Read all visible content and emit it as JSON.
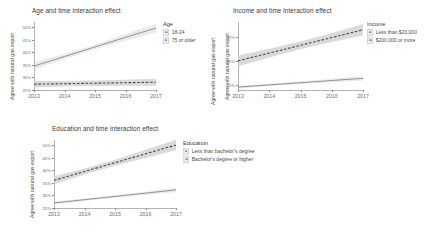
{
  "figure": {
    "y_axis_label": "Agree with natural gas export",
    "x_tick_labels": [
      "2013",
      "2014",
      "2015",
      "2016",
      "2017"
    ],
    "colors": {
      "ribbon": "#c9cccf",
      "solid_line": "#6f6f6f",
      "dashed_line": "#4a4a4a",
      "axis": "#b4b4b4",
      "tick_text": "#6d6d6d",
      "title_text": "#3a3a3a",
      "panel_background": "#ffffff"
    }
  },
  "panels": [
    {
      "id": "age",
      "title": "Age and time interaction effect",
      "y_axis_label": "Agree with natural gas export",
      "y_axis_label_right": "Agree with natural gas export",
      "legend": {
        "title": "Age",
        "items": [
          {
            "label": "18-24",
            "style": "solid"
          },
          {
            "label": "75 or older",
            "style": "dashed"
          }
        ]
      },
      "y_tick_labels": [
        "50%",
        "45%",
        "40%",
        "35%",
        "30%",
        "25%"
      ],
      "x_tick_labels": [
        "2013",
        "2014",
        "2015",
        "2016",
        "2017"
      ]
    },
    {
      "id": "income",
      "title": "Income and time interaction effect",
      "y_axis_label": "Agree with natural gas export",
      "legend": {
        "title": "Income",
        "items": [
          {
            "label": "Less than $20,000",
            "style": "dashed"
          },
          {
            "label": "$200,000 or more",
            "style": "solid"
          }
        ]
      },
      "y_tick_labels": [
        "50%",
        "40%",
        "30%"
      ],
      "x_tick_labels": [
        "2013",
        "2014",
        "2015",
        "2016",
        "2017"
      ]
    },
    {
      "id": "education",
      "title": "Education and time interaction effect",
      "y_axis_label": "Agree with natural gas export",
      "legend": {
        "title": "Education",
        "items": [
          {
            "label": "Less than bachelor's degree",
            "style": "dashed"
          },
          {
            "label": "Bachelor's degree or higher",
            "style": "solid"
          }
        ]
      },
      "y_tick_labels": [
        "50%",
        "45%",
        "40%",
        "35%",
        "30%",
        "25%"
      ],
      "x_tick_labels": [
        "2013",
        "2014",
        "2015",
        "2016",
        "2017"
      ]
    }
  ],
  "chart_data": [
    {
      "type": "line",
      "id": "age",
      "title": "Age and time interaction effect",
      "xlabel": "",
      "ylabel": "Agree with natural gas export",
      "x": [
        2013,
        2014,
        2015,
        2016,
        2017
      ],
      "xlim": [
        2013,
        2017
      ],
      "ylim": [
        25,
        52
      ],
      "yticks": [
        25,
        30,
        35,
        40,
        45,
        50
      ],
      "ytick_labels": [
        "25%",
        "30%",
        "35%",
        "40%",
        "45%",
        "50%"
      ],
      "grid": false,
      "legend_position": "right",
      "legend_title": "Age",
      "series": [
        {
          "name": "18-24",
          "style": "solid",
          "values": [
            34.5,
            38.3,
            42.1,
            45.9,
            49.6
          ],
          "ci_low": [
            33.0,
            37.2,
            41.2,
            44.6,
            47.8
          ],
          "ci_high": [
            36.0,
            39.4,
            43.0,
            47.2,
            51.4
          ]
        },
        {
          "name": "75 or older",
          "style": "dashed",
          "values": [
            27.3,
            27.5,
            27.7,
            27.9,
            28.1
          ],
          "ci_low": [
            26.0,
            26.4,
            26.6,
            26.7,
            26.7
          ],
          "ci_high": [
            28.6,
            28.6,
            28.8,
            29.1,
            29.5
          ]
        }
      ]
    },
    {
      "type": "line",
      "id": "income",
      "title": "Income and time interaction effect",
      "xlabel": "",
      "ylabel": "Agree with natural gas export",
      "x": [
        2013,
        2014,
        2015,
        2016,
        2017
      ],
      "xlim": [
        2013,
        2017
      ],
      "ylim": [
        28,
        56
      ],
      "yticks": [
        30,
        40,
        50
      ],
      "ytick_labels": [
        "30%",
        "40%",
        "50%"
      ],
      "grid": false,
      "legend_position": "right",
      "legend_title": "Income",
      "series": [
        {
          "name": "Less than $20,000",
          "style": "dashed",
          "values": [
            40.0,
            43.2,
            46.4,
            49.6,
            52.8
          ],
          "ci_low": [
            37.8,
            41.4,
            44.8,
            47.8,
            50.4
          ],
          "ci_high": [
            42.2,
            45.0,
            48.0,
            51.4,
            55.2
          ]
        },
        {
          "name": "$200,000 or more",
          "style": "solid",
          "values": [
            29.2,
            30.1,
            31.0,
            31.9,
            32.8
          ],
          "ci_low": [
            28.5,
            29.6,
            30.5,
            31.2,
            31.8
          ],
          "ci_high": [
            29.9,
            30.6,
            31.5,
            32.6,
            33.8
          ]
        }
      ]
    },
    {
      "type": "line",
      "id": "education",
      "title": "Education and time interaction effect",
      "xlabel": "",
      "ylabel": "Agree with natural gas export",
      "x": [
        2013,
        2014,
        2015,
        2016,
        2017
      ],
      "xlim": [
        2013,
        2017
      ],
      "ylim": [
        25,
        52
      ],
      "yticks": [
        25,
        30,
        35,
        40,
        45,
        50
      ],
      "ytick_labels": [
        "25%",
        "30%",
        "35%",
        "40%",
        "45%",
        "50%"
      ],
      "grid": false,
      "legend_position": "right",
      "legend_title": "Education",
      "series": [
        {
          "name": "Less than bachelor's degree",
          "style": "dashed",
          "values": [
            36.0,
            39.5,
            43.0,
            46.5,
            50.0
          ],
          "ci_low": [
            34.4,
            38.3,
            41.8,
            44.9,
            47.9
          ],
          "ci_high": [
            37.6,
            40.7,
            44.2,
            48.1,
            52.1
          ]
        },
        {
          "name": "Bachelor's degree or higher",
          "style": "solid",
          "values": [
            27.0,
            28.3,
            29.6,
            30.9,
            32.2
          ],
          "ci_low": [
            26.4,
            27.8,
            29.1,
            30.3,
            31.3
          ],
          "ci_high": [
            27.6,
            28.8,
            30.1,
            31.5,
            33.1
          ]
        }
      ]
    }
  ]
}
